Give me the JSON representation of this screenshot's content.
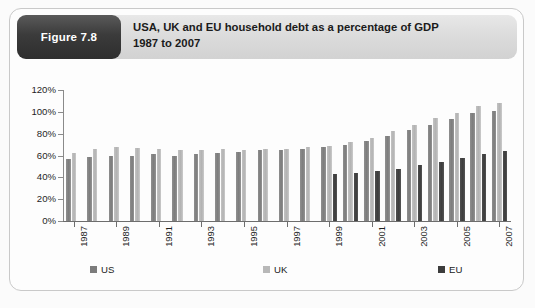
{
  "figure": {
    "badge_label": "Figure 7.8",
    "title_line1": "USA, UK and EU household debt as a percentage of GDP",
    "title_line2": "1987 to 2007"
  },
  "colors": {
    "us": "#7c7c7c",
    "uk": "#b8b8b8",
    "eu": "#3c3c3c",
    "axis": "#6d6d6d",
    "badge_bg": "#3b3b3b",
    "header_bg": "#dcdcdc",
    "card_border": "#c9c9c9"
  },
  "legend": {
    "position": "bottom",
    "items": [
      {
        "label": "US",
        "color": "#7c7c7c"
      },
      {
        "label": "UK",
        "color": "#b8b8b8"
      },
      {
        "label": "EU",
        "color": "#3c3c3c"
      }
    ]
  },
  "axis": {
    "y_ticks": [
      "0%",
      "20%",
      "40%",
      "60%",
      "80%",
      "100%",
      "120%"
    ],
    "x_ticks": [
      "1987",
      "1989",
      "1991",
      "1993",
      "1995",
      "1997",
      "1999",
      "2001",
      "2003",
      "2005",
      "2007"
    ]
  },
  "chart_data": {
    "type": "bar",
    "title": "USA, UK and EU household debt as a percentage of GDP 1987 to 2007",
    "xlabel": "",
    "ylabel": "",
    "ylim": [
      0,
      120
    ],
    "y_unit": "%",
    "grid": false,
    "legend_position": "bottom",
    "categories": [
      "1987",
      "1988",
      "1989",
      "1990",
      "1991",
      "1992",
      "1993",
      "1994",
      "1995",
      "1996",
      "1997",
      "1998",
      "1999",
      "2000",
      "2001",
      "2002",
      "2003",
      "2004",
      "2005",
      "2006",
      "2007"
    ],
    "visible_tick_labels": [
      "1987",
      "1989",
      "1991",
      "1993",
      "1995",
      "1997",
      "1999",
      "2001",
      "2003",
      "2005",
      "2007"
    ],
    "series": [
      {
        "name": "US",
        "color": "#7c7c7c",
        "values": [
          57,
          59,
          60,
          60,
          61,
          60,
          61,
          62,
          63,
          65,
          65,
          66,
          68,
          70,
          73,
          78,
          83,
          88,
          93,
          99,
          101
        ]
      },
      {
        "name": "UK",
        "color": "#b8b8b8",
        "values": [
          62,
          66,
          68,
          67,
          66,
          65,
          65,
          66,
          65,
          66,
          66,
          68,
          69,
          72,
          76,
          82,
          88,
          94,
          99,
          105,
          108
        ]
      },
      {
        "name": "EU",
        "color": "#3c3c3c",
        "values": [
          null,
          null,
          null,
          null,
          null,
          null,
          null,
          null,
          null,
          null,
          null,
          null,
          43,
          44,
          46,
          48,
          51,
          54,
          58,
          61,
          64
        ]
      }
    ]
  }
}
